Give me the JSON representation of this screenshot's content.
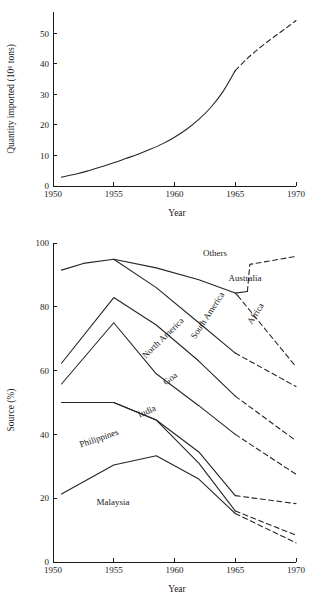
{
  "figure": {
    "background": "#ffffff",
    "ink_color": "#1a1a1a"
  },
  "chart_data": [
    {
      "id": "quantity-imported",
      "type": "line",
      "title": "",
      "xlabel": "Year",
      "ylabel": "Quantity imported (10⁶ tons)",
      "xlim": [
        1950,
        1970
      ],
      "ylim": [
        0,
        57
      ],
      "grid": false,
      "legend": "none",
      "xticks": [
        1950,
        1955,
        1960,
        1965,
        1970
      ],
      "xtick_labels": [
        "1950",
        "1955",
        "1960",
        "1965",
        "1970"
      ],
      "yticks": [
        0,
        10,
        20,
        30,
        40,
        50
      ],
      "ytick_labels": [
        "0",
        "10",
        "20",
        "30",
        "40",
        "50"
      ],
      "series": [
        {
          "name": "Quantity imported (observed)",
          "style": "solid",
          "x": [
            1950.7,
            1952,
            1953,
            1954,
            1955,
            1956,
            1957,
            1958,
            1959,
            1960,
            1961,
            1962,
            1963,
            1964,
            1965
          ],
          "values": [
            2.9,
            4.0,
            5.1,
            6.3,
            7.6,
            9.0,
            10.4,
            12.0,
            13.8,
            16.0,
            18.6,
            21.8,
            25.8,
            31.0,
            37.8
          ]
        },
        {
          "name": "Quantity imported (projected)",
          "style": "dashed",
          "x": [
            1965,
            1966,
            1967,
            1968,
            1969,
            1970
          ],
          "values": [
            37.8,
            41.8,
            45.2,
            48.3,
            51.2,
            54.2
          ]
        }
      ]
    },
    {
      "id": "source-percent",
      "type": "line",
      "title": "",
      "xlabel": "Year",
      "ylabel": "Source (%)",
      "xlim": [
        1950,
        1970
      ],
      "ylim": [
        0,
        100
      ],
      "grid": false,
      "legend": "inline-labels",
      "xticks": [
        1950,
        1955,
        1960,
        1965,
        1970
      ],
      "xtick_labels": [
        "1950",
        "1955",
        "1960",
        "1965",
        "1970"
      ],
      "yticks": [
        0,
        20,
        40,
        60,
        80,
        100
      ],
      "ytick_labels": [
        "0",
        "20",
        "40",
        "60",
        "80",
        "100"
      ],
      "series": [
        {
          "name": "Others",
          "label": "Others",
          "solid": {
            "x": [
              1950.7,
              1952.5,
              1955,
              1958.5,
              1962,
              1965,
              1966
            ],
            "values": [
              91.5,
              93.6,
              94.9,
              92.2,
              88.5,
              84.3,
              84.8
            ]
          },
          "dashed": {
            "x": [
              1966,
              1966.2,
              1970
            ],
            "values": [
              84.8,
              93.3,
              95.8
            ]
          }
        },
        {
          "name": "Australia",
          "label": "Australia",
          "solid": {
            "x": [],
            "values": []
          },
          "dashed": {
            "x": [],
            "values": []
          }
        },
        {
          "name": "South America",
          "label": "South America",
          "solid": {
            "x": [
              1955,
              1958.5,
              1962,
              1965
            ],
            "values": [
              94.9,
              86.0,
              75.0,
              65.5
            ]
          },
          "dashed": {
            "x": [
              1965,
              1970
            ],
            "values": [
              65.5,
              55.0
            ]
          }
        },
        {
          "name": "Africa",
          "label": "Africa",
          "solid": {
            "x": [
              1965,
              1965.2
            ],
            "values": [
              84.3,
              83.5
            ]
          },
          "dashed": {
            "x": [
              1965.2,
              1970
            ],
            "values": [
              83.5,
              61.2
            ]
          }
        },
        {
          "name": "North America",
          "label": "North America",
          "solid": {
            "x": [
              1950.7,
              1955,
              1958.5,
              1962,
              1965
            ],
            "values": [
              62.3,
              82.9,
              74.3,
              63.0,
              52.0
            ]
          },
          "dashed": {
            "x": [
              1965,
              1970
            ],
            "values": [
              52.0,
              38.0
            ]
          }
        },
        {
          "name": "Goa",
          "label": "Goa",
          "solid": {
            "x": [
              1950.7,
              1955,
              1958.5,
              1962,
              1965
            ],
            "values": [
              55.8,
              75.0,
              59.0,
              49.0,
              40.0
            ]
          },
          "dashed": {
            "x": [
              1965,
              1970
            ],
            "values": [
              40.0,
              27.5
            ]
          }
        },
        {
          "name": "India",
          "label": "India",
          "solid": {
            "x": [
              1950.7,
              1955,
              1958.5,
              1962,
              1965
            ],
            "values": [
              50.0,
              50.0,
              44.5,
              34.5,
              20.8
            ]
          },
          "dashed": {
            "x": [
              1965,
              1970
            ],
            "values": [
              20.8,
              18.3
            ]
          }
        },
        {
          "name": "Philippines",
          "label": "Philippines",
          "solid": {
            "x": [
              1950.7,
              1955,
              1958.5,
              1962,
              1965
            ],
            "values": [
              50.0,
              50.0,
              44.5,
              31.0,
              16.0
            ]
          },
          "dashed": {
            "x": [
              1965,
              1970
            ],
            "values": [
              16.0,
              8.4
            ]
          }
        },
        {
          "name": "Malaysia",
          "label": "Malaysia",
          "solid": {
            "x": [
              1950.7,
              1955,
              1958.5,
              1962,
              1965
            ],
            "values": [
              21.3,
              30.4,
              33.3,
              26.0,
              15.2
            ]
          },
          "dashed": {
            "x": [
              1965,
              1970
            ],
            "values": [
              15.2,
              6.0
            ]
          }
        }
      ],
      "inline_labels": [
        {
          "text": "Others",
          "x": 215,
          "y": 256,
          "rotate": 0
        },
        {
          "text": "Australia",
          "x": 245,
          "y": 281,
          "rotate": 0
        },
        {
          "text": "South America",
          "x": 210,
          "y": 317,
          "rotate": -57
        },
        {
          "text": "Africa",
          "x": 258,
          "y": 315,
          "rotate": -57
        },
        {
          "text": "North America",
          "x": 165,
          "y": 340,
          "rotate": -44
        },
        {
          "text": "Goa",
          "x": 172,
          "y": 381,
          "rotate": -38
        },
        {
          "text": "India",
          "x": 148,
          "y": 414,
          "rotate": -24
        },
        {
          "text": "Philippines",
          "x": 100,
          "y": 441,
          "rotate": -19
        },
        {
          "text": "Malaysia",
          "x": 113,
          "y": 505,
          "rotate": 0
        }
      ]
    }
  ]
}
